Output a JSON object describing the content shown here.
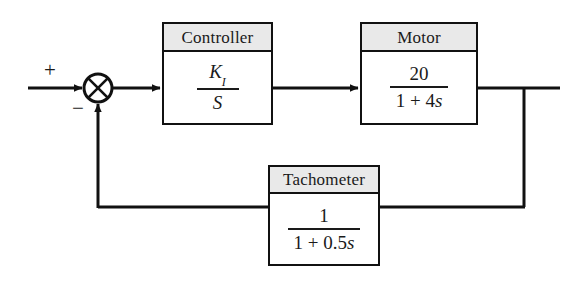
{
  "diagram": {
    "background_color": "#ffffff",
    "line_color": "#111111",
    "header_fill_color": "#e9e9e9",
    "text_color": "#1a1a1a"
  },
  "summing_junction": {
    "name": "summing-junction",
    "shape": "circle-with-x",
    "center_x": 98,
    "center_y": 88,
    "radius": 14,
    "input_sign": "+",
    "feedback_sign": "−"
  },
  "blocks": [
    {
      "id": "controller",
      "header": "Controller",
      "numerator": "K",
      "numerator_subscript": "I",
      "denominator": "S",
      "transfer_function": "K_I / S"
    },
    {
      "id": "motor",
      "header": "Motor",
      "numerator": "20",
      "denominator_prefix": "1 + 4",
      "denominator_variable": "s",
      "transfer_function": "20 / (1 + 4s)"
    },
    {
      "id": "tachometer",
      "header": "Tachometer",
      "numerator": "1",
      "denominator_prefix": "1 + 0.5",
      "denominator_variable": "s",
      "transfer_function": "1 / (1 + 0.5s)"
    }
  ],
  "signals": [
    {
      "name": "reference-input",
      "from": "left-edge",
      "to": "summing-junction",
      "arrow": true
    },
    {
      "name": "error-signal",
      "from": "summing-junction",
      "to": "controller",
      "arrow": true
    },
    {
      "name": "control-signal",
      "from": "controller",
      "to": "motor",
      "arrow": true
    },
    {
      "name": "output-signal",
      "from": "motor",
      "to": "right-edge",
      "arrow": false
    },
    {
      "name": "feedback-tap",
      "from": "output-signal",
      "to": "tachometer",
      "arrow": false
    },
    {
      "name": "feedback-signal",
      "from": "tachometer",
      "to": "summing-junction",
      "arrow": true
    }
  ]
}
